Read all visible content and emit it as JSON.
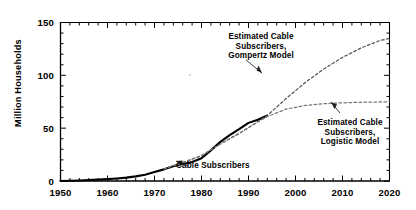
{
  "chart_data": {
    "type": "line",
    "title": "",
    "xlabel": "",
    "ylabel": "Million Households",
    "xlim": [
      1950,
      2020
    ],
    "ylim": [
      0,
      150
    ],
    "xticks": [
      1950,
      1960,
      1970,
      1980,
      1990,
      2000,
      2010,
      2020
    ],
    "yticks": [
      0,
      50,
      100,
      150
    ],
    "xtick_labels": [
      "1950",
      "1960",
      "1970",
      "1980",
      "1990",
      "2000",
      "2010",
      "2020"
    ],
    "ytick_labels": [
      "0",
      "50",
      "100",
      "150"
    ],
    "minor_tick_step_x": 2,
    "minor_tick_step_y": 10,
    "grid": false,
    "legend": "none",
    "series": [
      {
        "name": "Cable Subscribers",
        "style": "solid",
        "color": "#000000",
        "x": [
          1950,
          1952,
          1954,
          1956,
          1958,
          1960,
          1962,
          1964,
          1966,
          1968,
          1970,
          1972,
          1974,
          1976,
          1978,
          1980,
          1982,
          1984,
          1986,
          1988,
          1990,
          1992,
          1994
        ],
        "y": [
          0.0,
          0.2,
          0.5,
          0.9,
          1.3,
          1.8,
          2.4,
          3.2,
          4.4,
          6.0,
          8.5,
          11.0,
          14.0,
          16.0,
          18.0,
          21.5,
          29.0,
          37.0,
          43.5,
          49.0,
          55.0,
          58.0,
          62.0
        ]
      },
      {
        "name": "Estimated Cable Subscribers, Gompertz Model",
        "style": "dashed",
        "color": "#555555",
        "x": [
          1972,
          1976,
          1980,
          1984,
          1988,
          1992,
          1994,
          1998,
          2002,
          2006,
          2010,
          2014,
          2018,
          2020
        ],
        "y": [
          11.5,
          17.5,
          24.0,
          35.0,
          45.0,
          56.0,
          62.0,
          78.0,
          93.0,
          106.0,
          117.0,
          126.0,
          133.0,
          135.0
        ]
      },
      {
        "name": "Estimated Cable Subscribers, Logistic Model",
        "style": "dashed",
        "color": "#777777",
        "x": [
          1972,
          1976,
          1980,
          1984,
          1988,
          1992,
          1994,
          1998,
          2002,
          2006,
          2010,
          2014,
          2018,
          2020
        ],
        "y": [
          11.5,
          17.5,
          24.0,
          35.0,
          45.0,
          56.0,
          61.0,
          68.0,
          71.5,
          73.2,
          74.0,
          74.5,
          74.8,
          75.0
        ]
      }
    ],
    "annotations": [
      {
        "id": "gompertz",
        "lines": [
          "Estimated Cable",
          "Subscribers,",
          "Gompertz Model"
        ],
        "text": "Estimated Cable Subscribers, Gompertz Model"
      },
      {
        "id": "logistic",
        "lines": [
          "Estimated Cable",
          "Subscribers,",
          "Logistic Model"
        ],
        "text": "Estimated Cable Subscribers, Logistic Model"
      },
      {
        "id": "cable",
        "lines": [
          "Cable Subscribers"
        ],
        "text": "Cable Subscribers"
      }
    ]
  },
  "axis": {
    "ylabel": "Million Households",
    "ytick_0": "0",
    "ytick_1": "50",
    "ytick_2": "100",
    "ytick_3": "150",
    "xtick_0": "1950",
    "xtick_1": "1960",
    "xtick_2": "1970",
    "xtick_3": "1980",
    "xtick_4": "1990",
    "xtick_5": "2000",
    "xtick_6": "2010",
    "xtick_7": "2020"
  },
  "annotations": {
    "gompertz_l1": "Estimated Cable",
    "gompertz_l2": "Subscribers,",
    "gompertz_l3": "Gompertz Model",
    "logistic_l1": "Estimated Cable",
    "logistic_l2": "Subscribers,",
    "logistic_l3": "Logistic Model",
    "cable": "Cable Subscribers"
  },
  "colors": {
    "axis": "#000000",
    "data_line": "#000000",
    "gompertz_line": "#555555",
    "logistic_line": "#777777",
    "background": "#ffffff"
  }
}
